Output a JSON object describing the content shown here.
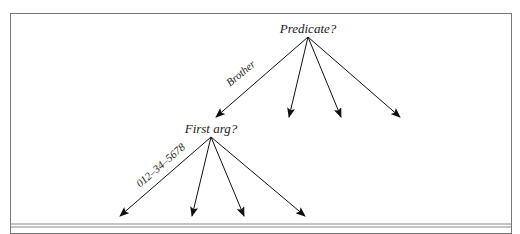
{
  "diagram": {
    "root": {
      "label": "Predicate?",
      "x": 308,
      "y": 37,
      "edges": [
        {
          "label": "Brother",
          "to": [
            216,
            117
          ]
        },
        {
          "label": "",
          "to": [
            289,
            117
          ]
        },
        {
          "label": "",
          "to": [
            341,
            117
          ]
        },
        {
          "label": "",
          "to": [
            400,
            117
          ]
        }
      ]
    },
    "child": {
      "label": "First arg?",
      "x": 211,
      "y": 137,
      "edges": [
        {
          "label": "012–34–5678",
          "to": [
            120,
            216
          ]
        },
        {
          "label": "",
          "to": [
            192,
            216
          ]
        },
        {
          "label": "",
          "to": [
            244,
            216
          ]
        },
        {
          "label": "",
          "to": [
            305,
            216
          ]
        }
      ]
    }
  }
}
